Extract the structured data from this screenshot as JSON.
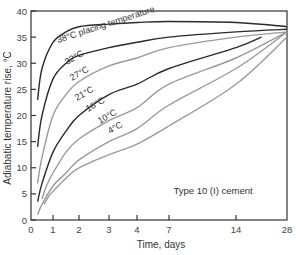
{
  "chart_data": {
    "type": "line",
    "title": "",
    "xlabel": "Time, days",
    "ylabel": "Adiabatic temperature rise, °C",
    "xlim": [
      0,
      28
    ],
    "ylim": [
      0,
      40
    ],
    "x_ticks": [
      0,
      1,
      2,
      3,
      4,
      7,
      14,
      28
    ],
    "y_ticks": [
      0,
      5,
      10,
      15,
      20,
      25,
      30,
      35,
      40
    ],
    "x_scale": "nonlinear (compressed beyond 4 days)",
    "grid": false,
    "annotation": "Type 10 (I) cement",
    "series": [
      {
        "name": "38°C placing temperature",
        "label": "38°C placing temperature",
        "color": "#2a2a2a",
        "x": [
          0.3,
          0.5,
          1,
          1.5,
          2,
          3,
          4,
          7,
          14,
          28
        ],
        "y": [
          23,
          29,
          34,
          36,
          37,
          37.5,
          37.8,
          38,
          37.8,
          37
        ]
      },
      {
        "name": "32°C",
        "label": "32°C",
        "color": "#2a2a2a",
        "x": [
          0.3,
          0.5,
          1,
          1.5,
          2,
          3,
          4,
          7,
          14,
          28
        ],
        "y": [
          14,
          20,
          27,
          30,
          31.5,
          33,
          34,
          35,
          36,
          36.5
        ]
      },
      {
        "name": "27°C",
        "label": "27°C",
        "color": "#9a9a9a",
        "x": [
          0.3,
          0.5,
          1,
          1.5,
          2,
          3,
          4,
          7,
          14,
          28
        ],
        "y": [
          7,
          12,
          20,
          24,
          26.5,
          29.5,
          31,
          33,
          35,
          36
        ]
      },
      {
        "name": "21°C",
        "label": "21°C",
        "color": "#2a2a2a",
        "x": [
          0.3,
          0.5,
          1,
          1.5,
          2,
          3,
          4,
          7,
          14,
          21
        ],
        "y": [
          3.5,
          7,
          13,
          17,
          20,
          24,
          26,
          29,
          33,
          35
        ]
      },
      {
        "name": "16°C",
        "label": "16°C",
        "color": "#9a9a9a",
        "x": [
          0.5,
          0.7,
          1,
          1.5,
          2,
          3,
          4,
          7,
          14,
          28
        ],
        "y": [
          4,
          6.5,
          9,
          13,
          15.5,
          19,
          21.5,
          26,
          31,
          36
        ]
      },
      {
        "name": "10°C",
        "label": "10°C",
        "color": "#9a9a9a",
        "x": [
          0.3,
          0.5,
          1,
          1.5,
          2,
          3,
          4,
          7,
          14,
          28
        ],
        "y": [
          1,
          3,
          6.5,
          9,
          11.5,
          15,
          17.5,
          22,
          29,
          36
        ]
      },
      {
        "name": "4°C",
        "label": "4°C",
        "color": "#9a9a9a",
        "x": [
          0.6,
          0.8,
          1,
          1.5,
          2,
          3,
          4,
          7,
          14,
          28
        ],
        "y": [
          3,
          4.5,
          5.5,
          8,
          10,
          12.5,
          14.5,
          18,
          26,
          35
        ]
      }
    ]
  }
}
